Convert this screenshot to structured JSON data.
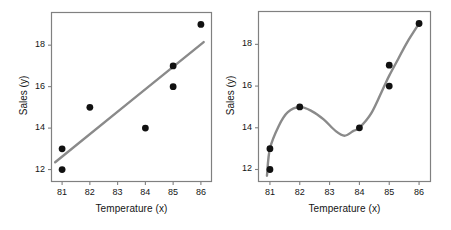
{
  "figure": {
    "background": "#ffffff",
    "marker_color": "#111111",
    "line_color": "#8a8a8a",
    "frame_color": "#808080",
    "text_color": "#151515"
  },
  "panels": [
    {
      "name": "left-panel",
      "fit_type": "linear-regression-line",
      "chart_ref": 0
    },
    {
      "name": "right-panel",
      "fit_type": "smooth-interpolating-curve",
      "chart_ref": 1
    }
  ],
  "chart_data": [
    {
      "type": "scatter",
      "title": "",
      "xlabel": "Temperature (x)",
      "ylabel": "Sales (y)",
      "xlim": [
        80.6,
        86.4
      ],
      "ylim": [
        11.4,
        19.6
      ],
      "xticks": [
        81,
        82,
        83,
        84,
        85,
        86
      ],
      "xtick_labels": [
        "81",
        "82",
        "83",
        "84",
        "85",
        "86"
      ],
      "yticks": [
        12,
        14,
        16,
        18
      ],
      "ytick_labels": [
        "12",
        "14",
        "16",
        "18"
      ],
      "grid": false,
      "legend": null,
      "points": [
        {
          "x": 81,
          "y": 12
        },
        {
          "x": 81,
          "y": 13
        },
        {
          "x": 82,
          "y": 15
        },
        {
          "x": 84,
          "y": 14
        },
        {
          "x": 85,
          "y": 16
        },
        {
          "x": 85,
          "y": 17
        },
        {
          "x": 86,
          "y": 19
        }
      ],
      "series": [
        {
          "name": "least-squares-fit",
          "type": "line",
          "x": [
            80.75,
            86.1
          ],
          "values": [
            12.35,
            18.15
          ]
        }
      ]
    },
    {
      "type": "scatter",
      "title": "",
      "xlabel": "Temperature (x)",
      "ylabel": "Sales (y)",
      "xlim": [
        80.6,
        86.4
      ],
      "ylim": [
        11.4,
        19.6
      ],
      "xticks": [
        81,
        82,
        83,
        84,
        85,
        86
      ],
      "xtick_labels": [
        "81",
        "82",
        "83",
        "84",
        "85",
        "86"
      ],
      "yticks": [
        12,
        14,
        16,
        18
      ],
      "ytick_labels": [
        "12",
        "14",
        "16",
        "18"
      ],
      "grid": false,
      "legend": null,
      "points": [
        {
          "x": 81,
          "y": 12
        },
        {
          "x": 81,
          "y": 13
        },
        {
          "x": 82,
          "y": 15
        },
        {
          "x": 84,
          "y": 14
        },
        {
          "x": 85,
          "y": 16
        },
        {
          "x": 85,
          "y": 17
        },
        {
          "x": 86,
          "y": 19
        }
      ],
      "series": [
        {
          "name": "overfit-spline",
          "type": "line",
          "x": [
            80.9,
            81.0,
            81.3,
            81.6,
            82.0,
            82.4,
            82.8,
            83.2,
            83.5,
            83.8,
            84.0,
            84.4,
            84.8,
            85.0,
            85.3,
            85.6,
            86.0
          ],
          "values": [
            11.7,
            13.0,
            14.1,
            14.75,
            15.0,
            14.8,
            14.4,
            13.85,
            13.62,
            13.85,
            14.0,
            14.7,
            15.9,
            16.5,
            17.3,
            18.1,
            19.0
          ]
        }
      ]
    }
  ]
}
